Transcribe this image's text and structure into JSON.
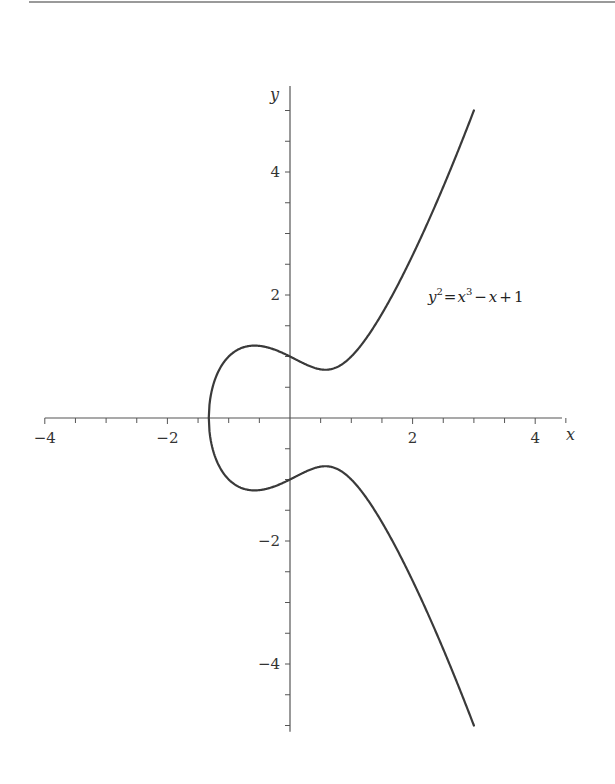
{
  "chart_data": {
    "type": "line",
    "title": "",
    "equation_label": "y² = x³ − x + 1",
    "equation_parts": {
      "y": "y",
      "y_exp": "2",
      "eq": "=",
      "x": "x",
      "x_exp": "3",
      "minus": "−",
      "x2": "x",
      "plus": "+",
      "one": "1"
    },
    "xlabel": "x",
    "ylabel": "y",
    "xlim": [
      -4,
      4.6
    ],
    "ylim": [
      -5.1,
      5.4
    ],
    "x_tick_labels": [
      "−4",
      "−2",
      "2",
      "4"
    ],
    "x_tick_values": [
      -4,
      -2,
      2,
      4
    ],
    "y_tick_labels": [
      "4",
      "2",
      "−2",
      "−4"
    ],
    "y_tick_values": [
      4,
      2,
      -2,
      -4
    ],
    "minor_tick_step": 0.5,
    "grid": false,
    "legend": "none",
    "series": [
      {
        "name": "y^2 = x^3 - x + 1 (upper branch)",
        "x": [
          -1.3247,
          -1.3,
          -1.2,
          -1.0,
          -0.8,
          -0.577,
          -0.4,
          -0.2,
          0.0,
          0.2,
          0.4,
          0.577,
          0.8,
          1.0,
          1.2,
          1.5,
          1.8,
          2.0,
          2.2,
          2.5,
          2.8,
          3.0
        ],
        "y": [
          0.0,
          0.35,
          0.73,
          1.0,
          1.13,
          1.17,
          1.16,
          1.09,
          1.0,
          0.9,
          0.82,
          0.79,
          0.84,
          1.0,
          1.23,
          1.7,
          2.27,
          2.65,
          3.06,
          3.7,
          4.38,
          5.0
        ]
      },
      {
        "name": "y^2 = x^3 - x + 1 (lower branch)",
        "x": [
          -1.3247,
          -1.3,
          -1.2,
          -1.0,
          -0.8,
          -0.577,
          -0.4,
          -0.2,
          0.0,
          0.2,
          0.4,
          0.577,
          0.8,
          1.0,
          1.2,
          1.5,
          1.8,
          2.0,
          2.2,
          2.5,
          2.8,
          3.0
        ],
        "y": [
          0.0,
          -0.35,
          -0.73,
          -1.0,
          -1.13,
          -1.17,
          -1.16,
          -1.09,
          -1.0,
          -0.9,
          -0.82,
          -0.79,
          -0.84,
          -1.0,
          -1.23,
          -1.7,
          -2.27,
          -2.65,
          -3.06,
          -3.7,
          -4.38,
          -5.0
        ]
      }
    ],
    "colors": {
      "curve": "#3a3a3a",
      "axes": "#555555",
      "text": "#333333"
    }
  }
}
